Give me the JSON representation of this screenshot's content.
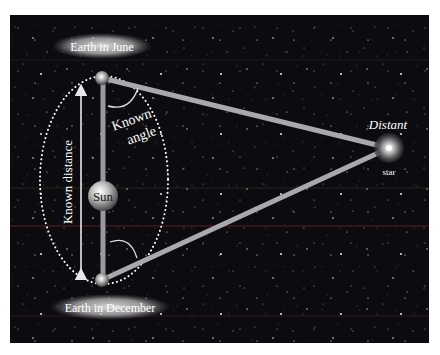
{
  "labels": {
    "earth_june": "Earth in June",
    "earth_december": "Earth in December",
    "sun": "Sun",
    "known_distance": "Known distance",
    "known_angle_line1": "Known",
    "known_angle_line2": "angle",
    "distant_star_line1": "Distant",
    "distant_star_line2": "star"
  },
  "colors": {
    "background": "#0c0c10",
    "beam": "#b8b8bc",
    "orbit_dots": "#ffffff",
    "label_glow": "#d8d8d8",
    "text": "#ffffff"
  },
  "positions": {
    "earth_june": [
      102,
      78
    ],
    "earth_december": [
      102,
      280
    ],
    "sun": [
      103,
      196
    ],
    "distant_star": [
      389,
      148
    ]
  }
}
